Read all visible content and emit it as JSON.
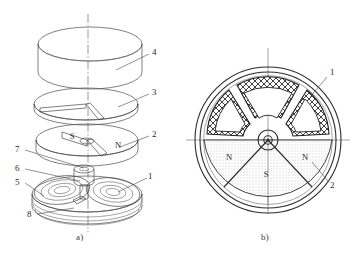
{
  "figure": {
    "background_color": "#ffffff",
    "line_color": "#4a4a4a",
    "heavy_line_color": "#2b2b2b",
    "fill_gray": "#cfcfcf",
    "stipple_gray": "#dcdcdc"
  },
  "captions": {
    "a": "a)",
    "b": "b)"
  },
  "view_a": {
    "name": "exploded-perspective-view",
    "callouts": [
      {
        "id": "4",
        "label": "4",
        "x": 152,
        "y": 52,
        "target_x": 116,
        "target_y": 70,
        "part": "top-housing-cylinder"
      },
      {
        "id": "3",
        "label": "3",
        "x": 152,
        "y": 92,
        "target_x": 118,
        "target_y": 107,
        "part": "upper-disc-plate"
      },
      {
        "id": "2",
        "label": "2",
        "x": 152,
        "y": 134,
        "target_x": 120,
        "target_y": 147,
        "part": "magnet-rotor-disc"
      },
      {
        "id": "7",
        "label": "7",
        "x": 18,
        "y": 148,
        "target_x": 82,
        "target_y": 168,
        "part": "hub-collar"
      },
      {
        "id": "6",
        "label": "6",
        "x": 18,
        "y": 167,
        "target_x": 80,
        "target_y": 181,
        "part": "shaft-bearing"
      },
      {
        "id": "5",
        "label": "5",
        "x": 18,
        "y": 181,
        "target_x": 44,
        "target_y": 196,
        "part": "stator-base-ring"
      },
      {
        "id": "1",
        "label": "1",
        "x": 150,
        "y": 176,
        "target_x": 118,
        "target_y": 192,
        "part": "flat-spiral-coil"
      },
      {
        "id": "8",
        "label": "8",
        "x": 30,
        "y": 215,
        "target_x": 72,
        "target_y": 210,
        "part": "base-plate-stack"
      }
    ],
    "magnet_poles": [
      {
        "label": "S",
        "x": 76,
        "y": 139
      },
      {
        "label": "N",
        "x": 121,
        "y": 146
      }
    ]
  },
  "view_b": {
    "name": "plan-section-view",
    "center": {
      "x": 268,
      "y": 140
    },
    "outer_radius": 75,
    "callouts": [
      {
        "id": "1",
        "label": "1",
        "x": 330,
        "y": 74,
        "target_x": 310,
        "target_y": 96,
        "part": "stator-coil-winding"
      },
      {
        "id": "2",
        "label": "2",
        "x": 330,
        "y": 184,
        "target_x": 312,
        "target_y": 166,
        "part": "magnet-rotor-disc"
      }
    ],
    "pole_labels": [
      {
        "label": "N",
        "x": 229,
        "y": 157
      },
      {
        "label": "S",
        "x": 266,
        "y": 174
      },
      {
        "label": "N",
        "x": 303,
        "y": 157
      }
    ],
    "coil_count": 3,
    "pole_count": 3
  }
}
